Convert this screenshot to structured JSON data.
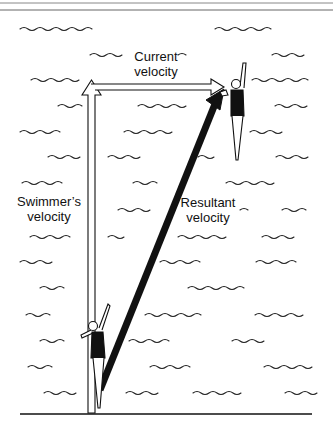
{
  "diagram": {
    "labels": {
      "current": [
        "Current",
        "velocity"
      ],
      "swimmer": [
        "Swimmer’s",
        "velocity"
      ],
      "resultant": [
        "Resultant",
        "velocity"
      ]
    },
    "vectors": [
      {
        "name": "swimmer-velocity",
        "style": "open-outline",
        "from": [
          91,
          412
        ],
        "to": [
          91,
          80
        ]
      },
      {
        "name": "current-velocity",
        "style": "open-outline",
        "from": [
          91,
          87
        ],
        "to": [
          222,
          87
        ]
      },
      {
        "name": "resultant-velocity",
        "style": "bold-solid",
        "from": [
          98,
          390
        ],
        "to": [
          222,
          90
        ]
      }
    ],
    "figures": [
      {
        "name": "swimmer-start",
        "position": "bottom-left"
      },
      {
        "name": "swimmer-end",
        "position": "top-right"
      }
    ],
    "colors": {
      "ink": "#111111",
      "background": "#ffffff"
    }
  }
}
